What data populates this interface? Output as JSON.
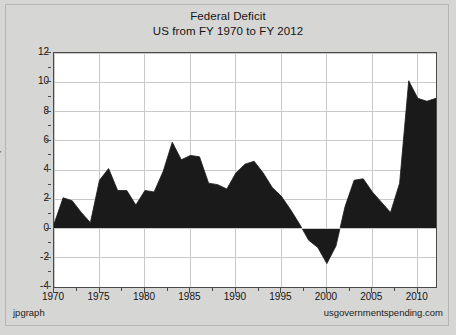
{
  "figure": {
    "title_line1": "Federal Deficit",
    "title_line2": "US from FY 1970 to FY 2012",
    "footer_left": "jpgraph",
    "footer_right": "usgovernmentspending.com",
    "background_color": "#d6d6d4",
    "plot_background_color": "#ffffff",
    "series_color": "#1a1a1a",
    "grid_color": "#c9c9c9",
    "axis_color": "#4a4a4a"
  },
  "chart_data": {
    "type": "area",
    "title": "Federal Deficit\nUS from FY 1970 to FY 2012",
    "xlabel": "",
    "ylabel": "percent GDP",
    "xlim": [
      1970,
      2012
    ],
    "ylim": [
      -4,
      12
    ],
    "yticks": [
      12,
      10,
      8,
      6,
      4,
      2,
      0,
      -2,
      -4
    ],
    "xticks": [
      1970,
      1975,
      1980,
      1985,
      1990,
      1995,
      2000,
      2005,
      2010
    ],
    "grid": true,
    "legend": "none",
    "minor_ticks": true,
    "baseline": 0,
    "x": [
      1970,
      1971,
      1972,
      1973,
      1974,
      1975,
      1976,
      1977,
      1978,
      1979,
      1980,
      1981,
      1982,
      1983,
      1984,
      1985,
      1986,
      1987,
      1988,
      1989,
      1990,
      1991,
      1992,
      1993,
      1994,
      1995,
      1996,
      1997,
      1998,
      1999,
      2000,
      2001,
      2002,
      2003,
      2004,
      2005,
      2006,
      2007,
      2008,
      2009,
      2010,
      2011,
      2012
    ],
    "series": [
      {
        "name": "Federal Deficit (percent GDP)",
        "values": [
          0.3,
          2.1,
          1.9,
          1.1,
          0.4,
          3.3,
          4.1,
          2.6,
          2.6,
          1.6,
          2.6,
          2.5,
          3.9,
          5.9,
          4.7,
          5.0,
          4.9,
          3.1,
          3.0,
          2.7,
          3.8,
          4.4,
          4.6,
          3.8,
          2.8,
          2.2,
          1.3,
          0.3,
          -0.8,
          -1.3,
          -2.4,
          -1.2,
          1.5,
          3.3,
          3.4,
          2.5,
          1.8,
          1.1,
          3.1,
          10.1,
          8.9,
          8.7,
          8.9
        ]
      }
    ]
  }
}
